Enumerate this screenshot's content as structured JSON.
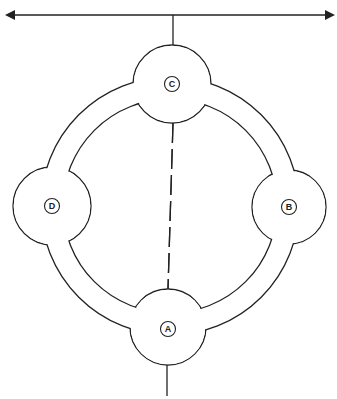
{
  "diagram": {
    "type": "ring network with nodes",
    "colors": {
      "stroke": "#222222",
      "background": "#ffffff"
    },
    "bus": {
      "description": "horizontal double-headed arrow at top",
      "y": 15,
      "x_start": 5,
      "x_end": 335
    },
    "ring": {
      "center": [
        170,
        206
      ],
      "outer_radius": 129,
      "inner_radius": 107
    },
    "nodes": [
      {
        "id": "C",
        "label": "C",
        "cx": 172,
        "cy": 84,
        "r": 39
      },
      {
        "id": "B",
        "label": "B",
        "cx": 289,
        "cy": 207,
        "r": 37
      },
      {
        "id": "A",
        "label": "A",
        "cx": 168,
        "cy": 327,
        "r": 38
      },
      {
        "id": "D",
        "label": "D",
        "cx": 52,
        "cy": 206,
        "r": 39
      }
    ],
    "labels": {
      "C": "C",
      "B": "B",
      "A": "A",
      "D": "D"
    },
    "connections": [
      {
        "from": "bus",
        "to": "C",
        "style": "solid"
      },
      {
        "from": "C",
        "to": "A",
        "style": "dashed"
      },
      {
        "from": "A",
        "to": "bottom",
        "style": "solid"
      }
    ]
  }
}
